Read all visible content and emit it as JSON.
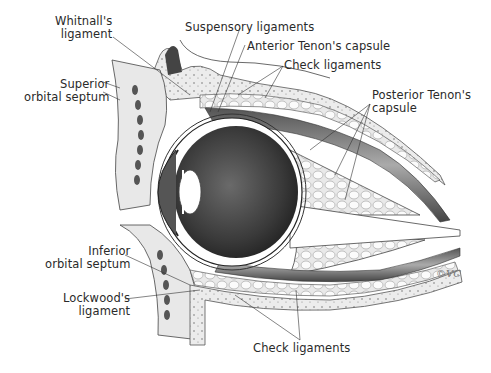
{
  "figure": {
    "colors": {
      "ink": "#2a2a2a",
      "globe": "#3e3e3e",
      "fat": "#f2f2f2",
      "bone": "#e6e6e6",
      "background": "#ffffff"
    }
  },
  "labels": {
    "whitnalls": {
      "line1": "Whitnall's",
      "line2": "ligament"
    },
    "superior_septum": {
      "line1": "Superior",
      "line2": "orbital  septum"
    },
    "suspensory": {
      "text": "Suspensory  ligaments"
    },
    "anterior_tenon": {
      "text": "Anterior  Tenon's  capsule"
    },
    "check_top": {
      "text": "Check  ligaments"
    },
    "posterior_tenon": {
      "line1": "Posterior  Tenon's",
      "line2": "capsule"
    },
    "inferior_septum": {
      "line1": "Inferior",
      "line2": "orbital  septum"
    },
    "lockwoods": {
      "line1": "Lockwood's",
      "line2": "ligament"
    },
    "check_bottom": {
      "text": "Check  ligaments"
    }
  },
  "signature": {
    "text": "©VC"
  }
}
